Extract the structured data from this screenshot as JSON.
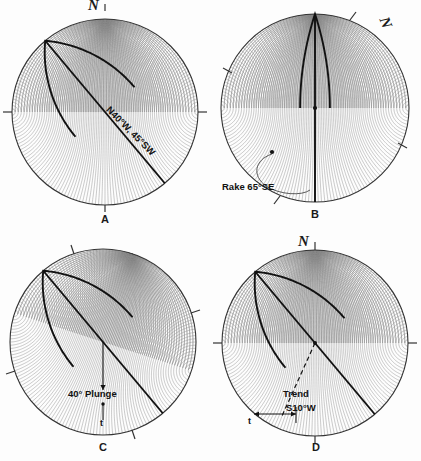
{
  "figure": {
    "type": "stereonet-figure",
    "background": "#fdfdfd",
    "ink": "#1a1a1a",
    "grid_color": "#777777",
    "panel_count": 4
  },
  "panels": [
    {
      "id": "A",
      "letter": "A",
      "north_label": "N",
      "north_rotation_deg": 0,
      "net_rotation_deg": 0,
      "center": {
        "x": 105,
        "y": 112
      },
      "radius": 93,
      "annotations": [
        {
          "name": "strike-dip-label",
          "text": "N40°W, 45°SW",
          "rotation_deg": 45,
          "x": 112,
          "y": 104
        }
      ],
      "features": [
        {
          "kind": "great-circle",
          "strike_deg": -40,
          "dip_deg": 45,
          "dip_dir": "SW"
        },
        {
          "kind": "chord",
          "from_deg": -40,
          "to_deg": 140
        }
      ],
      "ticks_deg": [
        0,
        90,
        180,
        270
      ]
    },
    {
      "id": "B",
      "letter": "B",
      "north_label": "N",
      "north_rotation_deg": 68,
      "net_rotation_deg": 0,
      "center": {
        "x": 105,
        "y": 108
      },
      "radius": 94,
      "annotations": [
        {
          "name": "rake-label",
          "text": "Rake 65°SE",
          "rotation_deg": 0,
          "x": 12,
          "y": 182
        }
      ],
      "features": [
        {
          "kind": "vertical-diameter"
        },
        {
          "kind": "great-circle-left-bulge",
          "dip_deg": 70
        },
        {
          "kind": "center-dot"
        },
        {
          "kind": "rake-dot"
        },
        {
          "kind": "leader-curve"
        }
      ],
      "ticks_deg": [
        22,
        118,
        202,
        298
      ]
    },
    {
      "id": "C",
      "letter": "C",
      "north_label": "",
      "north_rotation_deg": 0,
      "net_rotation_deg": 18,
      "center": {
        "x": 103,
        "y": 112
      },
      "radius": 93,
      "annotations": [
        {
          "name": "plunge-label",
          "text": "40° Plunge",
          "rotation_deg": 0,
          "x": 70,
          "y": 163
        },
        {
          "name": "trend-tick-label",
          "text": "t",
          "rotation_deg": 0,
          "x": 99,
          "y": 186
        }
      ],
      "features": [
        {
          "kind": "great-circle",
          "strike_deg": -40,
          "dip_deg": 45,
          "dip_dir": "SW"
        },
        {
          "kind": "chord",
          "from_deg": -40,
          "to_deg": 140
        },
        {
          "kind": "plunge-arrow"
        },
        {
          "kind": "center-dot"
        }
      ],
      "ticks_deg": [
        18,
        108,
        198,
        288
      ]
    },
    {
      "id": "D",
      "letter": "D",
      "north_label": "N",
      "north_rotation_deg": 0,
      "net_rotation_deg": 0,
      "center": {
        "x": 105,
        "y": 112
      },
      "radius": 93,
      "annotations": [
        {
          "name": "trend-label",
          "text": "Trend",
          "rotation_deg": 0,
          "x": 74,
          "y": 161
        },
        {
          "name": "bearing-label",
          "text": "S10°W",
          "rotation_deg": 0,
          "x": 78,
          "y": 174
        },
        {
          "name": "trend-tick-label",
          "text": "t",
          "rotation_deg": 0,
          "x": 38,
          "y": 184
        }
      ],
      "features": [
        {
          "kind": "great-circle",
          "strike_deg": -40,
          "dip_deg": 45,
          "dip_dir": "SW"
        },
        {
          "kind": "chord",
          "from_deg": -40,
          "to_deg": 140
        },
        {
          "kind": "dashed-trend-line"
        },
        {
          "kind": "center-dot"
        },
        {
          "kind": "trend-arrow"
        }
      ],
      "ticks_deg": [
        0,
        90,
        180,
        270
      ]
    }
  ]
}
